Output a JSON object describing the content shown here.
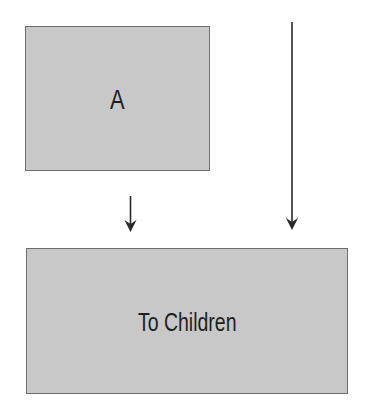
{
  "diagram": {
    "nodes": [
      {
        "id": "a",
        "label": "A"
      },
      {
        "id": "to-children",
        "label": "To Children"
      }
    ],
    "edges": [
      {
        "from": "a",
        "to": "to-children",
        "style": "short-arrow"
      },
      {
        "from": "above",
        "to": "to-children",
        "style": "long-arrow"
      }
    ],
    "colors": {
      "box_fill": "#c8c8c8",
      "box_border": "#6e6e6e",
      "arrow": "#2a2a2a",
      "text": "#1e1e1e"
    }
  }
}
